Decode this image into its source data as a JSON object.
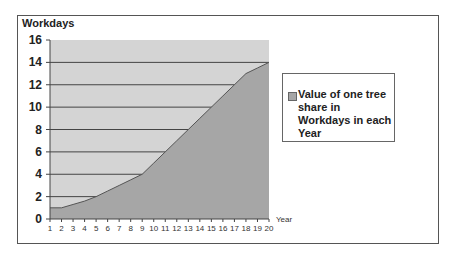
{
  "chart_data": {
    "type": "area",
    "title": "",
    "xlabel": "Year",
    "ylabel": "Workdays",
    "x": [
      1,
      2,
      3,
      4,
      5,
      6,
      7,
      8,
      9,
      10,
      11,
      12,
      13,
      14,
      15,
      16,
      17,
      18,
      19,
      20
    ],
    "series": [
      {
        "name": "Value of one tree share in Workdays in each Year",
        "values": [
          1,
          1,
          1.3,
          1.6,
          2,
          2.5,
          3,
          3.5,
          4,
          5,
          6,
          7,
          8,
          9,
          10,
          11,
          12,
          13,
          13.5,
          14
        ]
      }
    ],
    "ylim": [
      0,
      16
    ],
    "yticks": [
      0,
      2,
      4,
      6,
      8,
      10,
      12,
      14,
      16
    ],
    "xticks": [
      1,
      2,
      3,
      4,
      5,
      6,
      7,
      8,
      9,
      10,
      11,
      12,
      13,
      14,
      15,
      16,
      17,
      18,
      19,
      20
    ],
    "grid": "horizontal",
    "legend_position": "right"
  },
  "colors": {
    "plot_background": "#d4d4d4",
    "area_fill": "#a6a6a6",
    "gridline": "#444444",
    "series_line": "#555555"
  },
  "labels": {
    "y_axis_title": "Workdays",
    "x_axis_title": "Year",
    "legend": "Value of one tree share in Workdays in each Year"
  }
}
